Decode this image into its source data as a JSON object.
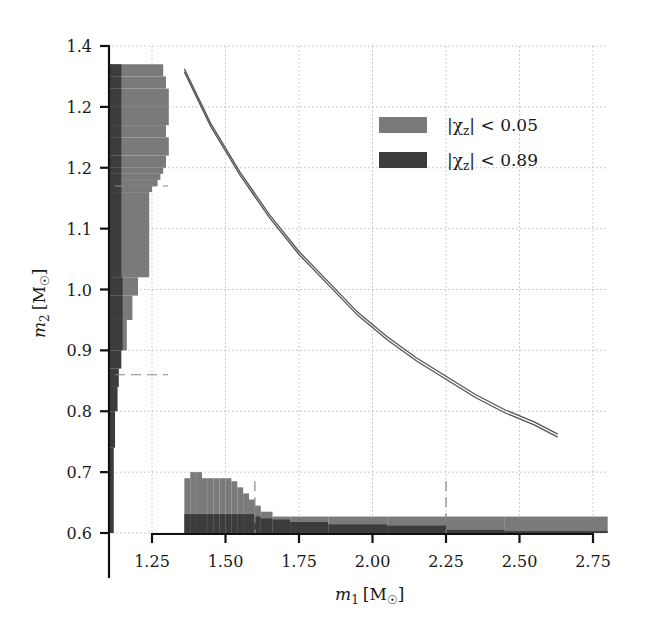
{
  "chart_data": {
    "type": "line",
    "title": "",
    "xlabel": "m1 [M☉]",
    "ylabel": "m2 [M☉]",
    "xlabel_main": "m",
    "xlabel_sub": "1",
    "xlabel_unit": "[M",
    "ylabel_main": "m",
    "ylabel_sub": "2",
    "ylabel_unit": "[M",
    "xlim": [
      1.1,
      2.8
    ],
    "ylim": [
      0.6,
      1.4
    ],
    "x_ticks": [
      1.25,
      1.5,
      1.75,
      2.0,
      2.25,
      2.5,
      2.75
    ],
    "x_tick_labels": [
      "1.25",
      "1.50",
      "1.75",
      "2.00",
      "2.25",
      "2.50",
      "2.75"
    ],
    "y_ticks": [
      1.4,
      1.3,
      1.2,
      1.1,
      1.0,
      0.9,
      0.8,
      0.7,
      0.6
    ],
    "y_tick_labels": [
      "1.4",
      "1.2",
      "1.2",
      "1.1",
      "1.0",
      "0.9",
      "0.8",
      "0.7",
      "0.6"
    ],
    "grid": true,
    "legend_position": "upper right",
    "legend": [
      {
        "label_prefix": "|χ",
        "label_sub": "z",
        "label_suffix": "| < 0.05",
        "color": "#7a7a7a"
      },
      {
        "label_prefix": "|χ",
        "label_sub": "z",
        "label_suffix": "| < 0.89",
        "color": "#3c3c3c"
      }
    ],
    "series": [
      {
        "name": "m1-m2 degeneracy curve",
        "type": "line",
        "x": [
          1.36,
          1.45,
          1.55,
          1.65,
          1.75,
          1.85,
          1.95,
          2.05,
          2.15,
          2.25,
          2.35,
          2.45,
          2.55,
          2.63
        ],
        "y": [
          1.36,
          1.27,
          1.19,
          1.12,
          1.06,
          1.01,
          0.96,
          0.92,
          0.885,
          0.855,
          0.825,
          0.8,
          0.78,
          0.76
        ]
      }
    ],
    "histograms": {
      "m1_marginal": {
        "bins": [
          1.36,
          1.38,
          1.4,
          1.42,
          1.44,
          1.46,
          1.48,
          1.5,
          1.52,
          1.54,
          1.56,
          1.58,
          1.6,
          1.62,
          1.66,
          1.72,
          1.85,
          2.05,
          2.25,
          2.45,
          2.8
        ],
        "low_spin_heights": [
          0.69,
          0.7,
          0.7,
          0.69,
          0.69,
          0.69,
          0.69,
          0.69,
          0.685,
          0.675,
          0.665,
          0.655,
          0.645,
          0.635,
          0.627,
          0.627,
          0.627,
          0.627,
          0.627,
          0.627
        ],
        "high_spin_heights": [
          0.631,
          0.631,
          0.631,
          0.631,
          0.631,
          0.631,
          0.631,
          0.631,
          0.631,
          0.631,
          0.631,
          0.631,
          0.627,
          0.624,
          0.622,
          0.618,
          0.614,
          0.612,
          0.605,
          0.603
        ],
        "dashed_markers": [
          1.6,
          2.25
        ]
      },
      "m2_marginal": {
        "bins": [
          1.37,
          1.35,
          1.33,
          1.3,
          1.27,
          1.25,
          1.22,
          1.2,
          1.19,
          1.18,
          1.17,
          1.16,
          1.02,
          0.99,
          0.95,
          0.9,
          0.87,
          0.84,
          0.8,
          0.74,
          0.6
        ],
        "low_spin_widths": [
          1.29,
          1.3,
          1.31,
          1.31,
          1.3,
          1.31,
          1.3,
          1.29,
          1.28,
          1.27,
          1.25,
          1.24,
          1.2,
          1.18,
          1.16
        ],
        "high_spin_widths": [
          1.19,
          1.19,
          1.19,
          1.19,
          1.19,
          1.19,
          1.19,
          1.19,
          1.19,
          1.19,
          1.19,
          1.19,
          1.2,
          1.2,
          1.2,
          1.19,
          1.17,
          1.16,
          1.14,
          1.13
        ],
        "dashed_markers": [
          1.17,
          0.86
        ]
      }
    }
  },
  "colors": {
    "low_spin": "#7a7a7a",
    "high_spin": "#3c3c3c",
    "grid": "#bdbdbd",
    "axis": "#111111",
    "curve": "#555555"
  }
}
